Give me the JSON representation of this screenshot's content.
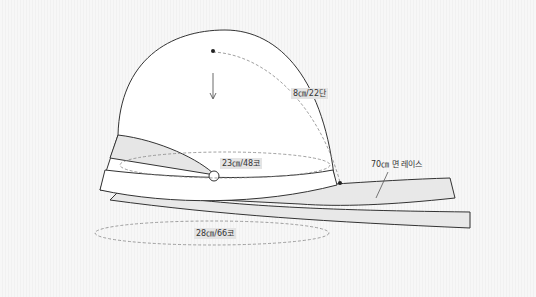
{
  "diagram": {
    "type": "knitting hat pattern",
    "colors": {
      "line": "#333333",
      "shade": "#e6e6e6",
      "dashed": "#888888",
      "label_bg": "#e4e4e4"
    },
    "labels": {
      "height": "8㎝/22단",
      "crown_circumference": "23㎝/48코",
      "brim_circumference": "28㎝/66코",
      "lace": "70㎝ 면 레이스"
    }
  }
}
